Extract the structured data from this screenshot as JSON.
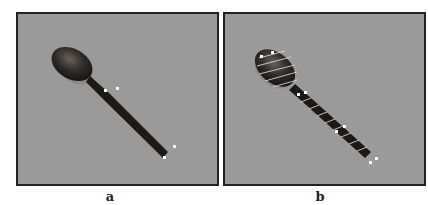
{
  "figure": {
    "panels": [
      {
        "label": "a",
        "description": "Spoon on gray background with four white corner markers on the handle"
      },
      {
        "label": "b",
        "description": "Spoon with white stripe lines across bowl and handle and white markers"
      }
    ]
  }
}
